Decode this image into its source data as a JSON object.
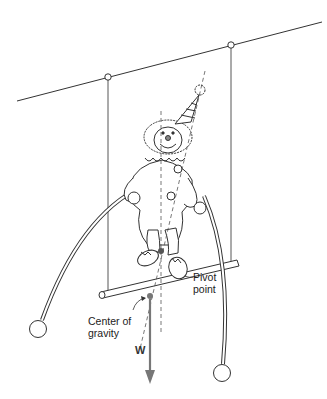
{
  "figure": {
    "labels": {
      "pivot_line1": "Pivot",
      "pivot_line2": "point",
      "cg_line1": "Center of",
      "cg_line2": "gravity",
      "weight": "W"
    },
    "colors": {
      "line": "#333333",
      "arrow": "#777777",
      "dot": "#555555"
    }
  }
}
